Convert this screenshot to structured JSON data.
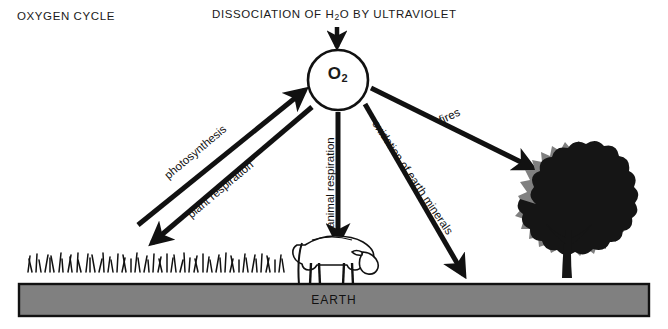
{
  "diagram": {
    "title_left": "OXYGEN CYCLE",
    "title_center_prefix": "DISSOCIATION OF H",
    "title_center_sub": "2",
    "title_center_suffix": "O BY ULTRAVIOLET",
    "center_node": {
      "symbol": "O",
      "subscript": "2"
    },
    "ground_label": "EARTH",
    "arrows": [
      {
        "name": "photosynthesis",
        "label": "photosynthesis",
        "direction": "up-right",
        "from": "grass",
        "to": "O2"
      },
      {
        "name": "plant-respiration",
        "label": "plant respiration",
        "direction": "down-left",
        "from": "O2",
        "to": "grass"
      },
      {
        "name": "animal-respiration",
        "label": "animal respiration",
        "direction": "down",
        "from": "O2",
        "to": "cow"
      },
      {
        "name": "oxidation-of-earth-minerals",
        "label": "oxidation of earth minerals",
        "direction": "down-right",
        "from": "O2",
        "to": "earth"
      },
      {
        "name": "fires",
        "label": "fires",
        "direction": "down-right",
        "from": "O2",
        "to": "tree"
      },
      {
        "name": "ultraviolet-input",
        "label": "",
        "direction": "down",
        "from": "ultraviolet",
        "to": "O2"
      }
    ],
    "elements": [
      {
        "name": "grass",
        "label": ""
      },
      {
        "name": "cow",
        "label": ""
      },
      {
        "name": "tree",
        "label": ""
      }
    ],
    "colors": {
      "background": "#ffffff",
      "ink": "#1a1a1a",
      "ground_fill": "#808080",
      "ground_border": "#111111",
      "tree_dark": "#151515",
      "tree_halo": "#808080"
    }
  }
}
